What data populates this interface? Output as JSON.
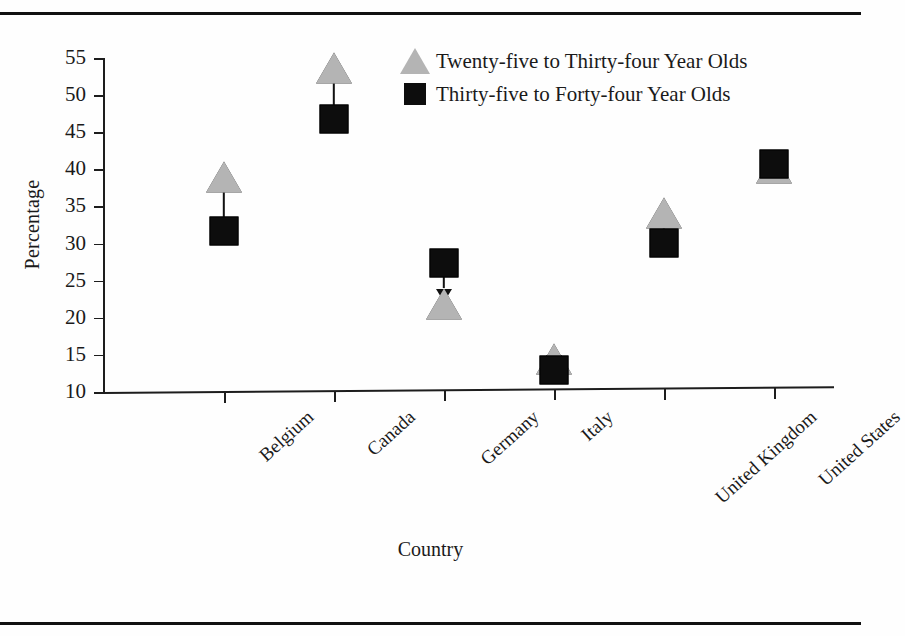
{
  "figure": {
    "rules": {
      "top": "page-rule-top",
      "bottom": "page-rule-bottom"
    }
  },
  "chart_data": {
    "type": "scatter",
    "title": "",
    "xlabel": "Country",
    "ylabel": "Percentage",
    "categories": [
      "Belgium",
      "Canada",
      "Germany",
      "Italy",
      "United Kingdom",
      "United States"
    ],
    "ylim": [
      10,
      55
    ],
    "yticks": [
      10,
      15,
      20,
      25,
      30,
      35,
      40,
      45,
      50,
      55
    ],
    "grid": false,
    "legend_position": "top-right",
    "series": [
      {
        "name": "Twenty-five to Thirty-four Year Olds",
        "marker": "triangle",
        "color": "#b4b4b4",
        "values": [
          38.8,
          53.4,
          21.5,
          14.0,
          33.5,
          39.5
        ]
      },
      {
        "name": "Thirty-five to Forty-four Year Olds",
        "marker": "square",
        "color": "#0d0d0d",
        "values": [
          31.6,
          46.5,
          27.0,
          12.5,
          29.5,
          40.0
        ]
      }
    ],
    "annotations": [
      {
        "category": "Belgium",
        "type": "arrow",
        "direction": "up",
        "from": 31.6,
        "to": 38.8
      },
      {
        "category": "Canada",
        "type": "arrow",
        "direction": "up",
        "from": 46.5,
        "to": 53.4
      },
      {
        "category": "Germany",
        "type": "arrow",
        "direction": "down",
        "from": 27.0,
        "to": 21.5
      },
      {
        "category": "Italy",
        "type": "arrow",
        "direction": "down",
        "from": 14.0,
        "to": 12.5
      },
      {
        "category": "United Kingdom",
        "type": "arrow",
        "direction": "up",
        "from": 29.5,
        "to": 33.5
      }
    ]
  },
  "legend": {
    "items": [
      {
        "label": "Twenty-five to Thirty-four Year Olds",
        "marker": "triangle"
      },
      {
        "label": "Thirty-five to Forty-four Year Olds",
        "marker": "square"
      }
    ]
  }
}
